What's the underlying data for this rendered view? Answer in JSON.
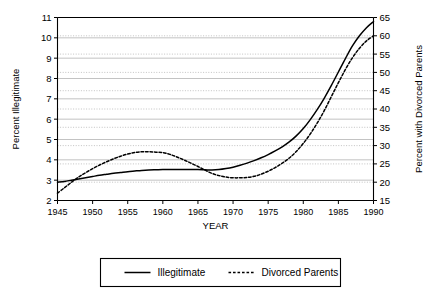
{
  "chart_data": {
    "type": "line",
    "title": "",
    "xlabel": "YEAR",
    "ylabel": "Percent Illegitimate",
    "y2label": "Percent with Divorced Parents",
    "xlim": [
      1945,
      1990
    ],
    "ylim": [
      2,
      11
    ],
    "y2lim": [
      15,
      65
    ],
    "grid": true,
    "legend_position": "bottom",
    "xticks": [
      1945,
      1950,
      1955,
      1960,
      1965,
      1970,
      1975,
      1980,
      1985,
      1990
    ],
    "xtick_labels": [
      "1945",
      "1950",
      "1955",
      "1960",
      "1965",
      "1970",
      "1975",
      "1980",
      "1985",
      "1990"
    ],
    "yticks": [
      2,
      3,
      4,
      5,
      6,
      7,
      8,
      9,
      10,
      11
    ],
    "ytick_labels": [
      "2",
      "3",
      "4",
      "5",
      "6",
      "7",
      "8",
      "9",
      "10",
      "11"
    ],
    "y2ticks": [
      15,
      20,
      25,
      30,
      35,
      40,
      45,
      50,
      55,
      60,
      65
    ],
    "y2tick_labels": [
      "15",
      "20",
      "25",
      "30",
      "35",
      "40",
      "45",
      "50",
      "55",
      "60",
      "65"
    ],
    "x": [
      1945,
      1946,
      1947,
      1948,
      1949,
      1950,
      1951,
      1952,
      1953,
      1954,
      1955,
      1956,
      1957,
      1958,
      1959,
      1960,
      1961,
      1962,
      1963,
      1964,
      1965,
      1966,
      1967,
      1968,
      1969,
      1970,
      1971,
      1972,
      1973,
      1974,
      1975,
      1976,
      1977,
      1978,
      1979,
      1980,
      1981,
      1982,
      1983,
      1984,
      1985,
      1986,
      1987,
      1988,
      1989,
      1990
    ],
    "series": [
      {
        "name": "Illegitimate",
        "axis": "left",
        "style": "solid",
        "color": "#000000",
        "values": [
          2.9,
          2.94,
          3.0,
          3.06,
          3.12,
          3.18,
          3.24,
          3.29,
          3.34,
          3.38,
          3.42,
          3.45,
          3.48,
          3.5,
          3.51,
          3.52,
          3.52,
          3.52,
          3.52,
          3.52,
          3.52,
          3.51,
          3.5,
          3.52,
          3.57,
          3.64,
          3.73,
          3.84,
          3.96,
          4.1,
          4.26,
          4.44,
          4.64,
          4.88,
          5.18,
          5.54,
          5.98,
          6.48,
          7.04,
          7.66,
          8.32,
          8.98,
          9.6,
          10.1,
          10.5,
          10.8
        ]
      },
      {
        "name": "Divorced Parents",
        "axis": "right",
        "style": "dotted",
        "color": "#000000",
        "values": [
          17.0,
          18.5,
          20.0,
          21.4,
          22.6,
          23.7,
          24.7,
          25.6,
          26.4,
          27.1,
          27.7,
          28.1,
          28.3,
          28.3,
          28.2,
          28.1,
          27.6,
          26.9,
          26.1,
          25.2,
          24.3,
          23.3,
          22.4,
          21.8,
          21.4,
          21.2,
          21.2,
          21.3,
          21.6,
          22.2,
          23.0,
          24.0,
          25.2,
          26.6,
          28.4,
          30.6,
          33.2,
          36.2,
          39.6,
          43.4,
          47.2,
          50.8,
          54.0,
          56.6,
          58.6,
          60.0
        ]
      }
    ],
    "annotations": []
  },
  "legend": {
    "items": [
      {
        "label": "Illegitimate",
        "style": "solid"
      },
      {
        "label": "Divorced Parents",
        "style": "dotted"
      }
    ]
  }
}
